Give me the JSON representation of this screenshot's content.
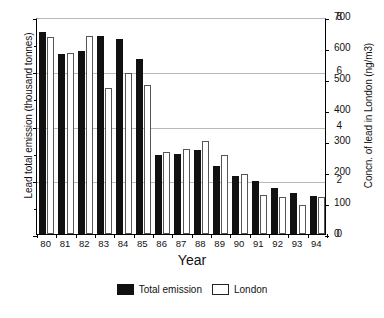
{
  "chart_data": {
    "type": "bar",
    "title": "",
    "xlabel": "Year",
    "ylabel": "Lead total emission (thousand tonnes)",
    "y2label": "Concn. of lead in London (ng/m3)",
    "categories": [
      "80",
      "81",
      "82",
      "83",
      "84",
      "85",
      "86",
      "87",
      "88",
      "89",
      "90",
      "91",
      "92",
      "93",
      "94"
    ],
    "ylim": [
      0,
      8
    ],
    "yticks": [
      0,
      2,
      4,
      6,
      8
    ],
    "y2lim": [
      0,
      700
    ],
    "y2ticks": [
      0,
      100,
      200,
      300,
      400,
      500,
      600,
      700
    ],
    "grid": true,
    "legend_position": "bottom-center",
    "series": [
      {
        "name": "Total emission",
        "axis": "left",
        "units": "thousand tonnes",
        "color": "#111111",
        "values": [
          7.45,
          6.65,
          6.75,
          7.3,
          7.2,
          6.45,
          2.9,
          2.95,
          3.1,
          2.5,
          2.15,
          1.95,
          1.7,
          1.5,
          1.4
        ]
      },
      {
        "name": "London",
        "axis": "right",
        "units": "ng/m3",
        "color": "#ffffff",
        "values": [
          635,
          585,
          640,
          470,
          520,
          480,
          265,
          275,
          300,
          255,
          195,
          125,
          120,
          95,
          120
        ]
      }
    ]
  },
  "legend": {
    "items": [
      {
        "label": "Total emission",
        "swatch": "black"
      },
      {
        "label": "London",
        "swatch": "white"
      }
    ]
  }
}
